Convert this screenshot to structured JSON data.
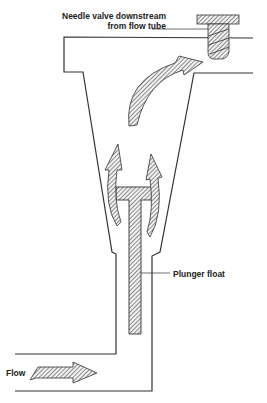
{
  "diagram": {
    "type": "variable-area flowmeter (rotameter) cross-section",
    "labels": {
      "needle_valve_line1": "Needle valve downstream",
      "needle_valve_line2": "from flow tube",
      "plunger_float": "Plunger float",
      "flow": "Flow"
    },
    "components": [
      {
        "id": "flow-tube",
        "description": "Tapered flow tube with inlet at bottom-left and outlet at top-right"
      },
      {
        "id": "plunger-float",
        "description": "T-shaped hatched plunger float inside tube"
      },
      {
        "id": "needle-valve",
        "description": "Hatched threaded needle valve at outlet"
      },
      {
        "id": "flow-arrows",
        "description": "Hatched arrows showing flow path: inlet, around float, up to outlet"
      }
    ],
    "colors": {
      "line": "#333333",
      "hatch": "#555555",
      "background": "#ffffff"
    }
  }
}
